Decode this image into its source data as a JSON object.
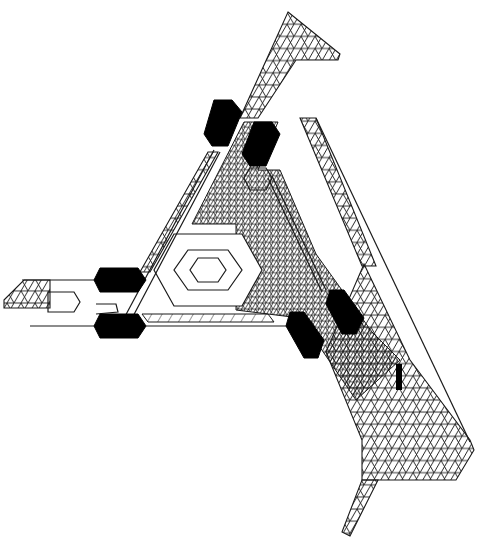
{
  "diagram": {
    "width": 482,
    "height": 540,
    "colors": {
      "background": "#ffffff",
      "line": "#1a1a1a",
      "fill": "#000000"
    },
    "coarse_mesh_regions": [
      {
        "name": "top-arm",
        "points": "288,12 340,54 338,60 296,60 258,118 240,118"
      },
      {
        "name": "right-outer-arm",
        "points": "300,118 316,118 376,266 362,266"
      },
      {
        "name": "right-lower-wedge",
        "points": "364,264 410,360 470,440 474,450 456,480 362,480 362,440 326,352"
      },
      {
        "name": "bottom-tail",
        "points": "362,480 378,480 350,536 342,532"
      },
      {
        "name": "left-rail",
        "points": "208,152 218,152 150,272 140,272"
      },
      {
        "name": "left-stub",
        "points": "4,300 24,280 50,280 50,308 4,308"
      }
    ],
    "fine_mesh_regions": [
      {
        "name": "center-dense-band",
        "points": "244,122 278,122 258,170 280,170 316,254 372,332 400,360 356,400 300,318 236,310 236,224 192,224"
      }
    ],
    "hatched_strips": [
      {
        "name": "bottom-hatch-bar",
        "points": "142,314 268,314 274,322 148,322"
      }
    ],
    "hexagons_concentric": [
      {
        "name": "outer-hex",
        "points": "174,234 242,234 262,270 242,306 174,306 154,270"
      },
      {
        "name": "middle-hex",
        "points": "188,250 228,250 242,270 228,290 188,290 174,270"
      },
      {
        "name": "inner-hex",
        "points": "198,258 218,258 226,270 218,282 198,282 190,270"
      }
    ],
    "outline_paths": [
      {
        "name": "outer-triangle-left",
        "d": "M 214 150 L 122 322"
      },
      {
        "name": "outer-triangle-left-inner",
        "d": "M 220 152 L 130 322"
      },
      {
        "name": "left-upper-arm",
        "d": "M 22 280 L 96 280"
      },
      {
        "name": "left-lower-arm",
        "d": "M 30 326 L 96 326"
      },
      {
        "name": "left-stub-hex",
        "d": "M 48 292 L 74 292 L 80 302 L 74 312 L 48 312 Z"
      },
      {
        "name": "left-notch",
        "d": "M 96 304 L 116 304 L 118 312 L 96 314"
      },
      {
        "name": "right-inner-rail-a",
        "d": "M 268 178 L 322 292"
      },
      {
        "name": "right-inner-rail-b",
        "d": "M 272 176 L 326 290"
      },
      {
        "name": "white-gap-hex",
        "d": "M 250 168 L 266 168 L 272 178 L 266 190 L 250 190 L 244 178 Z"
      },
      {
        "name": "outer-right-edge",
        "d": "M 316 118 L 470 442"
      },
      {
        "name": "bottom-baseline",
        "d": "M 146 326 L 290 326"
      }
    ],
    "black_hexagons": [
      {
        "name": "top-left-hex",
        "points": "214,100 232,100 242,112 228,146 212,146 204,134"
      },
      {
        "name": "top-right-hex",
        "points": "254,122 272,122 280,134 266,166 250,166 242,154"
      },
      {
        "name": "left-upper-hex",
        "points": "100,268 138,268 146,280 138,292 100,292 94,280"
      },
      {
        "name": "left-lower-hex",
        "points": "100,314 138,314 146,326 138,338 100,338 94,326"
      },
      {
        "name": "right-upper-hex",
        "points": "330,290 344,290 364,318 356,334 342,334 326,304"
      },
      {
        "name": "right-lower-hex",
        "points": "290,312 304,312 324,340 318,358 304,358 286,326"
      }
    ],
    "black_bars": [
      {
        "name": "small-vertical-bar",
        "x": 396,
        "y": 364,
        "w": 6,
        "h": 26
      }
    ]
  }
}
